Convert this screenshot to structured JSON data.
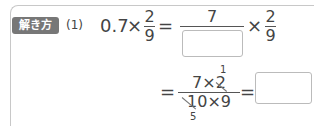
{
  "badge": {
    "label": "解き方",
    "color": "#777777"
  },
  "question_number": "(1)",
  "line1": {
    "lhs_decimal": "0.7",
    "times": "×",
    "frac1": {
      "num": "2",
      "den": "9"
    },
    "equals": "=",
    "frac2": {
      "num": "7",
      "den_blank": ""
    },
    "times2": "×",
    "frac3": {
      "num": "2",
      "den": "9"
    }
  },
  "line2": {
    "equals": "=",
    "frac": {
      "num": "7×2",
      "den": "10×9"
    },
    "cancel_above": "1",
    "cancel_below": "5",
    "equals2": "=",
    "answer_blank": ""
  }
}
